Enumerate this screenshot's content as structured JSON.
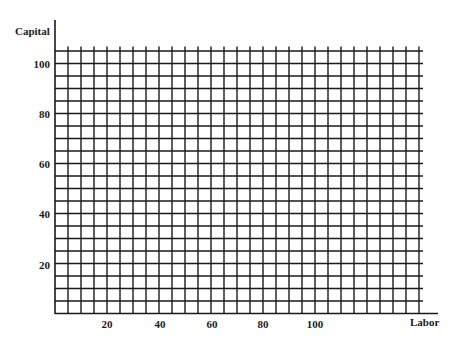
{
  "chart_data": {
    "type": "line",
    "title": "",
    "xlabel": "Labor",
    "ylabel": "Capital",
    "xlim": [
      0,
      140
    ],
    "ylim": [
      0,
      105
    ],
    "x_ticks": [
      20,
      40,
      60,
      80,
      100
    ],
    "y_ticks": [
      20,
      40,
      60,
      80,
      100
    ],
    "grid": true,
    "grid_step_x": 5,
    "grid_step_y": 5,
    "series": []
  },
  "labels": {
    "y_axis": "Capital",
    "x_axis": "Labor",
    "x_ticks": [
      "20",
      "40",
      "60",
      "80",
      "100"
    ],
    "y_ticks": [
      "100",
      "80",
      "60",
      "40",
      "20"
    ]
  },
  "colors": {
    "grid": "#1a1a1a",
    "background": "#ffffff"
  }
}
